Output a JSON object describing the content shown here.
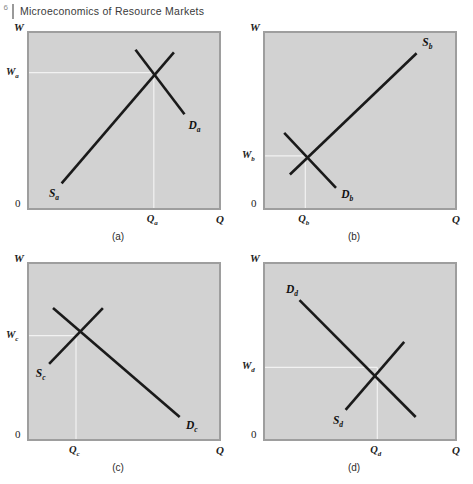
{
  "header": {
    "folio": "6",
    "title": "Microeconomics of Resource Markets"
  },
  "figure": {
    "axis_w_label": "W",
    "axis_q_label": "Q",
    "origin_label": "0",
    "plot_bg_color": "#d2d2d2",
    "plot_border_color": "#9e9e9e",
    "curve_color": "#1a1a1a",
    "guide_color": "#f2f2f2",
    "panels": [
      {
        "id": "a",
        "caption": "(a)",
        "price_tick": "W",
        "price_tick_sub": "a",
        "quantity_tick": "Q",
        "quantity_tick_sub": "a",
        "supply_label": "S",
        "supply_label_sub": "a",
        "demand_label": "D",
        "demand_label_sub": "a",
        "supply_elasticity": "elastic",
        "demand_elasticity": "inelastic",
        "equilibrium": {
          "q": 0.655,
          "w": 0.77
        }
      },
      {
        "id": "b",
        "caption": "(b)",
        "price_tick": "W",
        "price_tick_sub": "b",
        "quantity_tick": "Q",
        "quantity_tick_sub": "b",
        "supply_label": "S",
        "supply_label_sub": "b",
        "demand_label": "D",
        "demand_label_sub": "b",
        "supply_elasticity": "elastic",
        "demand_elasticity": "inelastic",
        "equilibrium": {
          "q": 0.215,
          "w": 0.3
        }
      },
      {
        "id": "c",
        "caption": "(c)",
        "price_tick": "W",
        "price_tick_sub": "c",
        "quantity_tick": "Q",
        "quantity_tick_sub": "c",
        "supply_label": "S",
        "supply_label_sub": "c",
        "demand_label": "D",
        "demand_label_sub": "c",
        "supply_elasticity": "inelastic",
        "demand_elasticity": "elastic",
        "equilibrium": {
          "q": 0.25,
          "w": 0.59
        }
      },
      {
        "id": "d",
        "caption": "(d)",
        "price_tick": "W",
        "price_tick_sub": "d",
        "quantity_tick": "Q",
        "quantity_tick_sub": "d",
        "supply_label": "S",
        "supply_label_sub": "d",
        "demand_label": "D",
        "demand_label_sub": "d",
        "supply_elasticity": "inelastic",
        "demand_elasticity": "elastic",
        "equilibrium": {
          "q": 0.59,
          "w": 0.41
        }
      }
    ]
  },
  "chart_data": {
    "type": "line",
    "xlabel": "Q",
    "ylabel": "W",
    "xlim": [
      0,
      1
    ],
    "ylim": [
      0,
      1
    ],
    "grid": false,
    "legend": "inline curve labels",
    "panels": [
      {
        "id": "a",
        "caption": "(a)",
        "equilibrium": {
          "Q": 0.655,
          "W": 0.77
        },
        "series": [
          {
            "name": "S_a",
            "role": "supply",
            "shape": "elastic",
            "points": [
              [
                0.175,
                0.145
              ],
              [
                0.76,
                0.885
              ]
            ]
          },
          {
            "name": "D_a",
            "role": "demand",
            "shape": "inelastic",
            "points": [
              [
                0.56,
                0.9
              ],
              [
                0.815,
                0.535
              ]
            ]
          }
        ]
      },
      {
        "id": "b",
        "caption": "(b)",
        "equilibrium": {
          "Q": 0.215,
          "W": 0.3
        },
        "series": [
          {
            "name": "S_b",
            "role": "supply",
            "shape": "elastic",
            "points": [
              [
                0.135,
                0.195
              ],
              [
                0.795,
                0.88
              ]
            ]
          },
          {
            "name": "D_b",
            "role": "demand",
            "shape": "inelastic",
            "points": [
              [
                0.105,
                0.43
              ],
              [
                0.375,
                0.12
              ]
            ]
          }
        ]
      },
      {
        "id": "c",
        "caption": "(c)",
        "equilibrium": {
          "Q": 0.25,
          "W": 0.59
        },
        "series": [
          {
            "name": "S_c",
            "role": "supply",
            "shape": "inelastic",
            "points": [
              [
                0.11,
                0.43
              ],
              [
                0.39,
                0.745
              ]
            ]
          },
          {
            "name": "D_c",
            "role": "demand",
            "shape": "elastic",
            "points": [
              [
                0.13,
                0.745
              ],
              [
                0.79,
                0.13
              ]
            ]
          }
        ]
      },
      {
        "id": "d",
        "caption": "(d)",
        "equilibrium": {
          "Q": 0.59,
          "W": 0.41
        },
        "series": [
          {
            "name": "S_d",
            "role": "supply",
            "shape": "inelastic",
            "points": [
              [
                0.425,
                0.17
              ],
              [
                0.73,
                0.555
              ]
            ]
          },
          {
            "name": "D_d",
            "role": "demand",
            "shape": "elastic",
            "points": [
              [
                0.185,
                0.79
              ],
              [
                0.79,
                0.13
              ]
            ]
          }
        ]
      }
    ]
  }
}
